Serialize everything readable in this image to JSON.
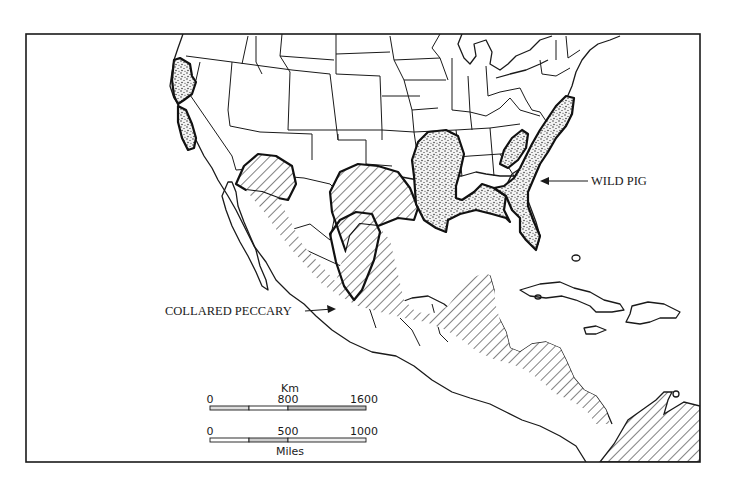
{
  "map": {
    "subject": "Distribution of collared peccary and wild pig in North and Central America",
    "frame_color": "#1a1a1a",
    "background": "#ffffff",
    "legend_labels": {
      "wild_pig": "WILD PIG",
      "collared_peccary": "COLLARED PECCARY"
    },
    "ranges": [
      {
        "species": "WILD PIG",
        "pattern": "stipple",
        "regions": [
          "California coast",
          "Louisiana / lower Mississippi valley",
          "Gulf coast",
          "Florida",
          "Atlantic coastal plain",
          "Southern Appalachians (Tennessee/North Carolina)"
        ]
      },
      {
        "species": "COLLARED PECCARY",
        "pattern": "diagonal-hatch",
        "regions": [
          "Arizona / New Mexico",
          "Texas",
          "Mexico",
          "Central America",
          "Northern South America"
        ]
      }
    ],
    "scale_bar": {
      "km": {
        "unit": "Km",
        "ticks": [
          "0",
          "800",
          "1600"
        ]
      },
      "miles": {
        "unit": "Miles",
        "ticks": [
          "0",
          "500",
          "1000"
        ]
      }
    }
  }
}
